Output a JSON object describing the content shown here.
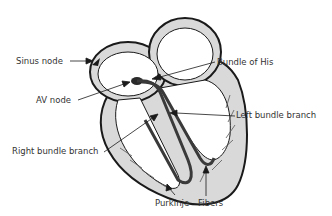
{
  "labels": {
    "sinus_node": "Sinus node",
    "av_node": "AV node",
    "bundle_of_his": "Bundle of His",
    "left_bundle_branch": "Left bundle branch",
    "right_bundle_branch": "Right bundle branch",
    "purkinje": "Purkinje",
    "fibers": "Fibers"
  },
  "colors": {
    "background": "#ffffff",
    "wall_fill": "#d9d9d9",
    "outline": "#1a1a1a",
    "conduction": "#3a3a3a",
    "text": "#333333"
  }
}
